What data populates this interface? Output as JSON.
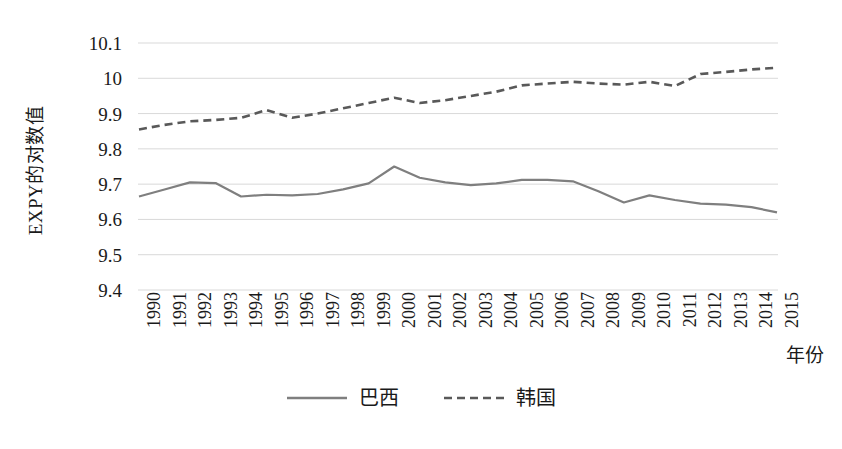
{
  "chart_data": {
    "type": "line",
    "title": "",
    "xlabel": "年份",
    "ylabel": "EXPY的对数值",
    "x": [
      1990,
      1991,
      1992,
      1993,
      1994,
      1995,
      1996,
      1997,
      1998,
      1999,
      2000,
      2001,
      2002,
      2003,
      2004,
      2005,
      2006,
      2007,
      2008,
      2009,
      2010,
      2011,
      2012,
      2013,
      2014,
      2015
    ],
    "categories": [
      "1990",
      "1991",
      "1992",
      "1993",
      "1994",
      "1995",
      "1996",
      "1997",
      "1998",
      "1999",
      "2000",
      "2001",
      "2002",
      "2003",
      "2004",
      "2005",
      "2006",
      "2007",
      "2008",
      "2009",
      "2010",
      "2011",
      "2012",
      "2013",
      "2014",
      "2015"
    ],
    "series": [
      {
        "name": "巴西",
        "style": "solid",
        "color": "#7f7f7f",
        "values": [
          9.665,
          9.685,
          9.705,
          9.703,
          9.665,
          9.67,
          9.668,
          9.672,
          9.685,
          9.702,
          9.75,
          9.718,
          9.705,
          9.697,
          9.702,
          9.712,
          9.712,
          9.708,
          9.68,
          9.648,
          9.668,
          9.655,
          9.645,
          9.642,
          9.635,
          9.62
        ]
      },
      {
        "name": "韩国",
        "style": "dashed",
        "color": "#595959",
        "values": [
          9.855,
          9.868,
          9.878,
          9.882,
          9.888,
          9.91,
          9.888,
          9.9,
          9.915,
          9.93,
          9.945,
          9.93,
          9.938,
          9.95,
          9.962,
          9.98,
          9.985,
          9.99,
          9.985,
          9.982,
          9.99,
          9.978,
          10.012,
          10.018,
          10.025,
          10.03
        ]
      }
    ],
    "ylim": [
      9.4,
      10.1
    ],
    "yticks": [
      9.4,
      9.5,
      9.6,
      9.7,
      9.8,
      9.9,
      10,
      10.1
    ],
    "ytick_labels": [
      "9.4",
      "9.5",
      "9.6",
      "9.7",
      "9.8",
      "9.9",
      "10",
      "10.1"
    ],
    "grid": true,
    "grid_color": "#d9d9d9",
    "legend_position": "bottom",
    "background": "#ffffff"
  }
}
